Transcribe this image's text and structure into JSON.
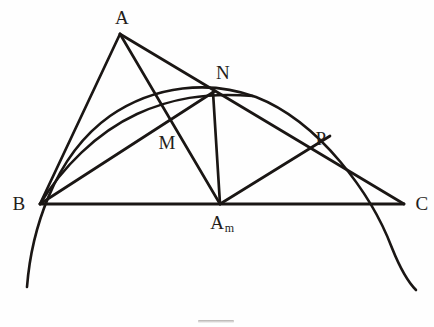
{
  "figure": {
    "background_color": "#fefefe",
    "stroke_color": "#1a1614",
    "label_color": "#241d1a",
    "stroke_width": 2.5,
    "width": 434,
    "height": 327
  },
  "labels": {
    "a": "A",
    "b": "B",
    "c": "C",
    "m": "M",
    "n": "N",
    "p": "P",
    "am_main": "A",
    "am_sub": "m"
  },
  "points": [
    {
      "id": "A",
      "label": "A",
      "x": 120,
      "y": 34,
      "label_x": 122,
      "label_y": 17
    },
    {
      "id": "B",
      "label": "B",
      "x": 40,
      "y": 204,
      "label_x": 19,
      "label_y": 203
    },
    {
      "id": "C",
      "label": "C",
      "x": 404,
      "y": 204,
      "label_x": 422,
      "label_y": 203
    },
    {
      "id": "M",
      "label": "M",
      "x": 167,
      "y": 116,
      "label_x": 167,
      "label_y": 142
    },
    {
      "id": "N",
      "label": "N",
      "x": 213,
      "y": 92,
      "label_x": 223,
      "label_y": 72
    },
    {
      "id": "P",
      "label": "P",
      "x": 308,
      "y": 150,
      "label_x": 321,
      "label_y": 138
    },
    {
      "id": "Am",
      "label": "Am",
      "x": 220,
      "y": 204,
      "label_x": 222,
      "label_y": 222
    }
  ],
  "segments": [
    {
      "id": "BA",
      "from": "B",
      "to": "A",
      "note": "side B to apex A"
    },
    {
      "id": "AC",
      "from": "A",
      "to": "C",
      "note": "apex A through N to C"
    },
    {
      "id": "BC",
      "from": "B",
      "to": "C",
      "note": "base chord B to C"
    },
    {
      "id": "AAm",
      "from": "A",
      "to": "Am",
      "note": "cevian A to A sub m, crosses B-N at M"
    },
    {
      "id": "BN",
      "from": "B",
      "to": "N",
      "note": "line B to N, crosses A-Am at M"
    },
    {
      "id": "AmP",
      "from": "Am",
      "to": "N",
      "note": "line A sub m up to N, crosses N-C at P"
    }
  ],
  "arcs": [
    {
      "id": "outer-arc",
      "note": "large circular arc through B, apex, C extending below the base line",
      "start_x": 27,
      "start_y": 287,
      "apex_x": 245,
      "apex_y": 88,
      "end_x": 416,
      "end_y": 290,
      "passes_through": [
        "B",
        "N",
        "C"
      ]
    },
    {
      "id": "inner-arc",
      "note": "smaller arc from B rising to meet N",
      "start_x": 40,
      "start_y": 204,
      "apex_x": 150,
      "apex_y": 110,
      "end_x": 253,
      "end_y": 96
    }
  ],
  "caption": {
    "visible_fragment": ""
  }
}
